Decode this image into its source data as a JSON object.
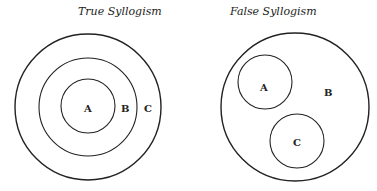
{
  "diagrams": [
    {
      "title": "True Syllogism",
      "circles": [
        {
          "label": "C",
          "cx": 88,
          "cy": 107,
          "r": 73
        },
        {
          "label": "B",
          "cx": 88,
          "cy": 107,
          "r": 49
        },
        {
          "label": "A",
          "cx": 88,
          "cy": 106,
          "r": 27
        }
      ],
      "labels": {
        "A": "A",
        "B": "B",
        "C": "C"
      }
    },
    {
      "title": "False Syllogism",
      "circles": [
        {
          "label": "B",
          "cx": 295,
          "cy": 107,
          "r": 74
        },
        {
          "label": "A",
          "cx": 265,
          "cy": 82,
          "r": 27
        },
        {
          "label": "C",
          "cx": 297,
          "cy": 141,
          "r": 27
        }
      ],
      "labels": {
        "A": "A",
        "B": "B",
        "C": "C"
      }
    }
  ],
  "colors": {
    "stroke": "#222222",
    "background": "#ffffff"
  }
}
